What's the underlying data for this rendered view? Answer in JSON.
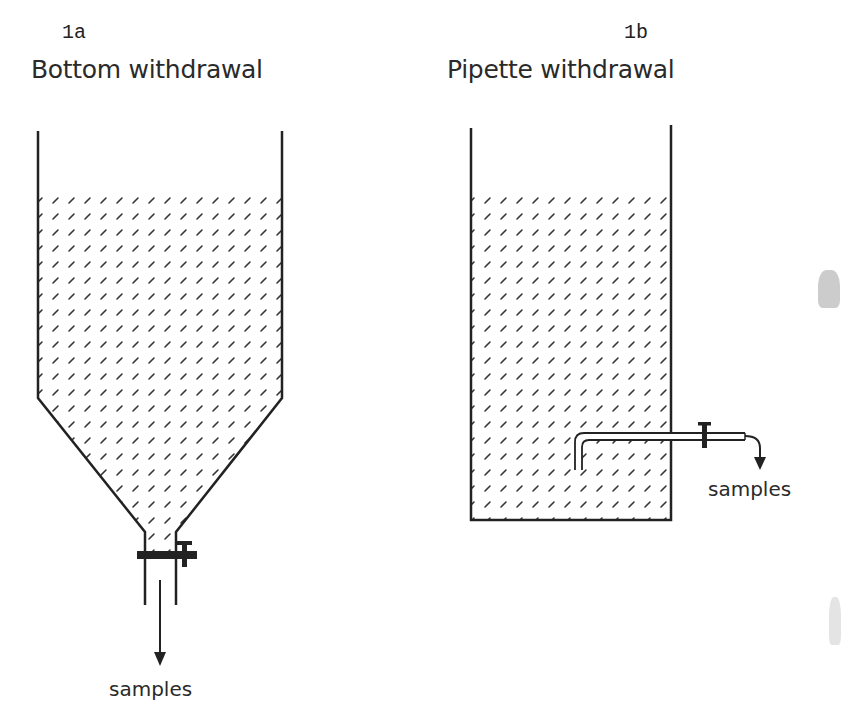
{
  "figure": {
    "panels": [
      {
        "id": "1a",
        "title": "Bottom withdrawal",
        "output_label": "samples",
        "vessel": "cylinder-with-conical-bottom",
        "withdrawal": "bottom valve"
      },
      {
        "id": "1b",
        "title": "Pipette withdrawal",
        "output_label": "samples",
        "vessel": "rectangular-column",
        "withdrawal": "side pipette with valve"
      }
    ]
  },
  "colors": {
    "line": "#222222",
    "hatch": "#333333",
    "background": "#ffffff"
  }
}
